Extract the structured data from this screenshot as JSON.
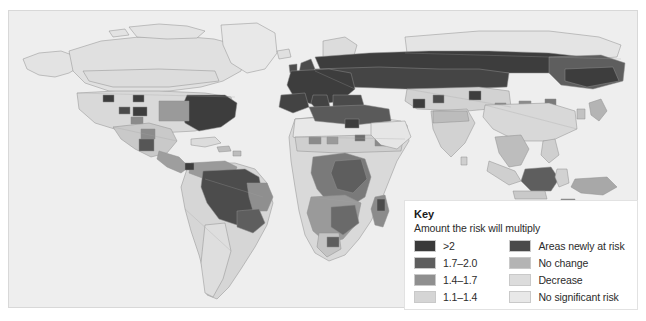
{
  "figure": {
    "type": "choropleth-world-map",
    "projection": "equirectangular-like",
    "background_color": "#eeeeee",
    "land_outline_color": "#8e8e8e",
    "base_land_color": "#e2e2e2"
  },
  "legend": {
    "title": "Key",
    "subtitle": "Amount the risk will multiply",
    "left_column": [
      {
        "label": ">2",
        "color": "#3a3a3a"
      },
      {
        "label": "1.7–2.0",
        "color": "#5e5e5e"
      },
      {
        "label": "1.4–1.7",
        "color": "#8f8f8f"
      },
      {
        "label": "1.1–1.4",
        "color": "#d5d5d5"
      }
    ],
    "right_column": [
      {
        "label": "Areas newly at risk",
        "color": "#4a4a4a"
      },
      {
        "label": "No change",
        "color": "#b4b4b4"
      },
      {
        "label": "Decrease",
        "color": "#dcdcdc"
      },
      {
        "label": "No significant risk",
        "color": "#e8e8e8"
      }
    ]
  },
  "map_regions": {
    "very_high_gt2": [
      "Eastern United States",
      "Western Europe",
      "Eastern Europe",
      "Western Russia",
      "Amazon Basin",
      "Borneo",
      "Madagascar highlands"
    ],
    "high_1_7_2_0": [
      "Central Europe",
      "Mediterranean",
      "Brazil southeast",
      "Central Africa",
      "Zambia",
      "Zimbabwe"
    ],
    "moderate_1_4_1_7": [
      "Central United States",
      "Mexico",
      "Central America",
      "Venezuela",
      "Colombia",
      "East Africa",
      "Southeast Asia",
      "Papua New Guinea"
    ],
    "low_1_1_1_4": [
      "Northern Canada",
      "Sahel",
      "India",
      "China",
      "Northern Australia"
    ],
    "no_significant_risk": [
      "Greenland",
      "Sahara",
      "Arabian Peninsula",
      "Siberia north",
      "Southern Argentina",
      "Southern Australia"
    ]
  }
}
